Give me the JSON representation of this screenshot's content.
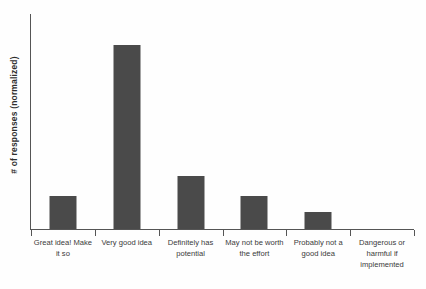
{
  "chart_data": {
    "type": "bar",
    "title": "",
    "subtitle": "",
    "xlabel": "",
    "ylabel": "# of responses (normalized)",
    "categories": [
      "Great idea! Make it so",
      "Very good idea",
      "Definitely has potential",
      "May not be worth the effort",
      "Probably not a good idea",
      "Dangerous or harmful if implemented"
    ],
    "values": [
      0.18,
      1.0,
      0.29,
      0.18,
      0.09,
      0.0
    ],
    "ylim": [
      0,
      1.17
    ],
    "grid": false,
    "legend": false,
    "orientation": "vertical",
    "bar_color": "#4a4a4a",
    "axis_color": "#555555",
    "y_tick_labels": [],
    "annotations": []
  },
  "figure": {
    "background": "#fefefe",
    "y_axis_label": "# of responses (normalized)",
    "category_labels": [
      "Great idea! Make it so",
      "Very good idea",
      "Definitely has potential",
      "May not be worth the effort",
      "Probably not a good idea",
      "Dangerous or harmful if implemented"
    ]
  }
}
